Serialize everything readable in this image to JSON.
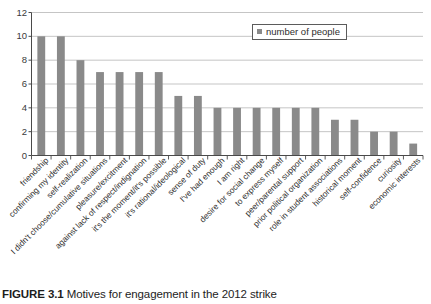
{
  "figure": {
    "caption_label": "FIGURE 3.1",
    "caption_text": "Motives for engagement in the 2012 strike"
  },
  "legend": {
    "label": "number of people",
    "swatch_color": "#8a8a8a",
    "position": "upper-right-inside"
  },
  "chart_data": {
    "type": "bar",
    "title": "",
    "xlabel": "",
    "ylabel": "",
    "ylim": [
      0,
      12
    ],
    "yticks": [
      0,
      2,
      4,
      6,
      8,
      10,
      12
    ],
    "ytick_labels": [
      "0",
      "2",
      "4",
      "6",
      "8",
      "10",
      "12"
    ],
    "grid": true,
    "grid_axis": "y",
    "bar_color": "#8a8a8a",
    "categories": [
      "friendship",
      "confirming my identity",
      "self-realization",
      "I didn't choose/cumulative situations",
      "pleasure/excitment",
      "against lack of respect/indignation",
      "it's the moment/it's possible",
      "it's rational/ideological",
      "sense of duty",
      "I've had enough",
      "I am right",
      "desire for social change",
      "to express myself",
      "peer/parental support",
      "prior political organization",
      "role in student associations",
      "historical moment",
      "self-confidence",
      "curiosity",
      "economic interests"
    ],
    "series": [
      {
        "name": "number of people",
        "values": [
          10,
          10,
          8,
          7,
          7,
          7,
          7,
          5,
          5,
          4,
          4,
          4,
          4,
          4,
          4,
          3,
          3,
          2,
          2,
          1
        ]
      }
    ]
  }
}
